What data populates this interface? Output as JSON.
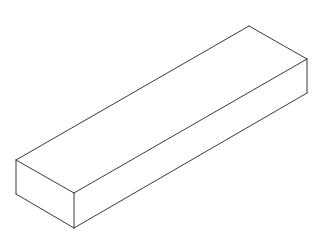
{
  "diagram": {
    "title": "",
    "type": "isometric-rectangular-prism",
    "line_color": "#3a3a3a",
    "background": "#ffffff",
    "vertices": {
      "top_left": [
        16,
        160
      ],
      "top_front": [
        74,
        193
      ],
      "top_right": [
        307,
        59
      ],
      "top_back": [
        249,
        26
      ],
      "bottom_left": [
        16,
        194
      ],
      "bottom_front": [
        74,
        228
      ],
      "bottom_right": [
        307,
        93
      ]
    }
  }
}
